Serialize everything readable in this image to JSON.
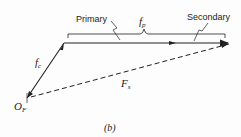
{
  "diagram": {
    "labels": {
      "primary": "Primary",
      "secondary": "Secondary",
      "fp": "f",
      "fp_sub": "p",
      "fc": "f",
      "fc_sub": "c",
      "Fs": "F",
      "Fs_sub": "s",
      "origin": "O",
      "origin_sub": "F",
      "caption": "(b)"
    },
    "colors": {
      "line": "#222222",
      "background": "#fdfdfd"
    }
  }
}
